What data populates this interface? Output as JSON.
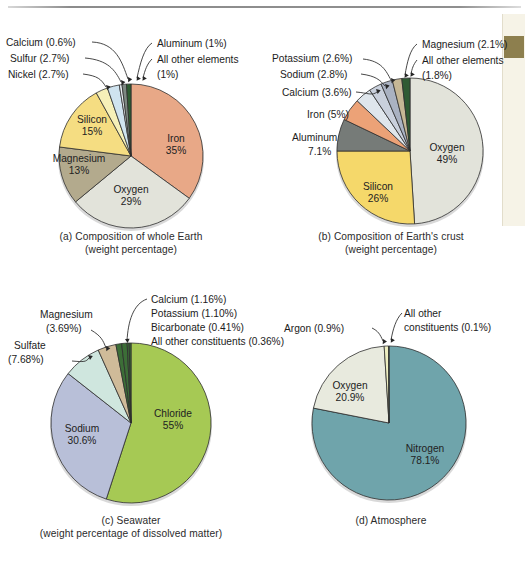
{
  "figure": {
    "title_visible": false,
    "background": "#ffffff",
    "rule_color": "#8c8c8c",
    "page_edge_color": "#f6f3e7",
    "page_tab_color": "#8d7f4e"
  },
  "chart_data": [
    {
      "id": "a",
      "type": "pie",
      "title": "(a) Composition of whole Earth",
      "subtitle": "(weight percentage)",
      "unit": "weight percent",
      "legend_position": "callout-labels",
      "categories": [
        "Iron",
        "Oxygen",
        "Magnesium",
        "Silicon",
        "Calcium",
        "Sulfur",
        "Nickel",
        "Aluminum",
        "All other elements"
      ],
      "values": [
        35,
        29,
        13,
        15,
        0.6,
        2.7,
        2.7,
        1,
        1
      ],
      "labels": [
        {
          "name": "Iron",
          "pct": "35%",
          "text": "Iron",
          "value_text": "35%",
          "inside": true,
          "color": "#e8a887"
        },
        {
          "name": "Oxygen",
          "pct": "29%",
          "text": "Oxygen",
          "value_text": "29%",
          "inside": true,
          "color": "#e2e3da"
        },
        {
          "name": "Magnesium",
          "pct": "13%",
          "text": "Magnesium",
          "value_text": "13%",
          "inside": true,
          "color": "#b3aa8d"
        },
        {
          "name": "Silicon",
          "pct": "15%",
          "text": "Silicon",
          "value_text": "15%",
          "inside": true,
          "color": "#f5dd82"
        },
        {
          "name": "Nickel",
          "pct": "2.7%",
          "text": "Nickel (2.7%)",
          "inside": false,
          "color": "#f6f0b8"
        },
        {
          "name": "Sulfur",
          "pct": "2.7%",
          "text": "Sulfur (2.7%)",
          "inside": false,
          "color": "#cfe3ef"
        },
        {
          "name": "Calcium",
          "pct": "0.6%",
          "text": "Calcium (0.6%)",
          "inside": false,
          "color": "#e8edf0"
        },
        {
          "name": "Aluminum",
          "pct": "1%",
          "text": "Aluminum (1%)",
          "inside": false,
          "color": "#7d8882"
        },
        {
          "name": "All other elements",
          "pct": "1%",
          "text": "All other elements",
          "text2": "(1%)",
          "inside": false,
          "color": "#2e5c32"
        }
      ]
    },
    {
      "id": "b",
      "type": "pie",
      "title": "(b) Composition of Earth's crust",
      "subtitle": "(weight percentage)",
      "unit": "weight percent",
      "legend_position": "callout-labels",
      "categories": [
        "Oxygen",
        "Silicon",
        "Aluminum",
        "Iron",
        "Calcium",
        "Sodium",
        "Potassium",
        "Magnesium",
        "All other elements"
      ],
      "values": [
        49,
        26,
        7.1,
        5,
        3.6,
        2.8,
        2.6,
        2.1,
        1.8
      ],
      "labels": [
        {
          "name": "Oxygen",
          "pct": "49%",
          "text": "Oxygen",
          "value_text": "49%",
          "inside": true,
          "color": "#e2e3da"
        },
        {
          "name": "Silicon",
          "pct": "26%",
          "text": "Silicon",
          "value_text": "26%",
          "inside": true,
          "color": "#f5d86a"
        },
        {
          "name": "Aluminum",
          "pct": "7.1%",
          "text": "Aluminum",
          "value_text": "7.1%",
          "inside": false,
          "color": "#767b78"
        },
        {
          "name": "Iron",
          "pct": "5%",
          "text": "Iron (5%)",
          "inside": false,
          "color": "#eca277"
        },
        {
          "name": "Calcium",
          "pct": "3.6%",
          "text": "Calcium (3.6%)",
          "inside": false,
          "color": "#dfe6ec"
        },
        {
          "name": "Sodium",
          "pct": "2.8%",
          "text": "Sodium (2.8%)",
          "inside": false,
          "color": "#c9d0dc"
        },
        {
          "name": "Potassium",
          "pct": "2.6%",
          "text": "Potassium (2.6%)",
          "inside": false,
          "color": "#aab2c2"
        },
        {
          "name": "Magnesium",
          "pct": "2.1%",
          "text": "Magnesium (2.1%)",
          "inside": false,
          "color": "#c6b795"
        },
        {
          "name": "All other elements",
          "pct": "1.8%",
          "text": "All other elements",
          "text2": "(1.8%)",
          "inside": false,
          "color": "#2f5b33"
        }
      ]
    },
    {
      "id": "c",
      "type": "pie",
      "title": "(c) Seawater",
      "subtitle": "(weight percentage of dissolved matter)",
      "unit": "weight percentage of dissolved matter",
      "legend_position": "callout-labels",
      "categories": [
        "Chloride",
        "Sodium",
        "Sulfate",
        "Magnesium",
        "Calcium",
        "Potassium",
        "Bicarbonate",
        "All other constituents"
      ],
      "values": [
        55,
        30.6,
        7.68,
        3.69,
        1.16,
        1.1,
        0.41,
        0.36
      ],
      "labels": [
        {
          "name": "Chloride",
          "pct": "55%",
          "text": "Chloride",
          "value_text": "55%",
          "inside": true,
          "color": "#a6c954"
        },
        {
          "name": "Sodium",
          "pct": "30.6%",
          "text": "Sodium",
          "value_text": "30.6%",
          "inside": true,
          "color": "#b8bfd8"
        },
        {
          "name": "Sulfate",
          "pct": "7.68%",
          "text": "Sulfate",
          "text2": "(7.68%)",
          "inside": false,
          "color": "#cfe6de"
        },
        {
          "name": "Magnesium",
          "pct": "3.69%",
          "text": "Magnesium",
          "text2": "(3.69%)",
          "inside": false,
          "color": "#cfbb99"
        },
        {
          "name": "Calcium",
          "pct": "1.16%",
          "text": "Calcium (1.16%)",
          "inside": false,
          "color": "#3c6e37"
        },
        {
          "name": "Potassium",
          "pct": "1.10%",
          "text": "Potassium (1.10%)",
          "inside": false,
          "color": "#3c6e37"
        },
        {
          "name": "Bicarbonate",
          "pct": "0.41%",
          "text": "Bicarbonate (0.41%)",
          "inside": false,
          "color": "#3c6e37"
        },
        {
          "name": "All other constituents",
          "pct": "0.36%",
          "text": "All other constituents (0.36%)",
          "inside": false,
          "color": "#3c6e37"
        }
      ]
    },
    {
      "id": "d",
      "type": "pie",
      "title": "(d) Atmosphere",
      "subtitle": "",
      "unit": "volume percentage",
      "legend_position": "callout-labels",
      "categories": [
        "Nitrogen",
        "Oxygen",
        "Argon",
        "All other constituents"
      ],
      "values": [
        78.1,
        20.9,
        0.9,
        0.1
      ],
      "labels": [
        {
          "name": "Nitrogen",
          "pct": "78.1%",
          "text": "Nitrogen",
          "value_text": "78.1%",
          "inside": true,
          "color": "#6fa4ab"
        },
        {
          "name": "Oxygen",
          "pct": "20.9%",
          "text": "Oxygen",
          "value_text": "20.9%",
          "inside": true,
          "color": "#e8eade"
        },
        {
          "name": "Argon",
          "pct": "0.9%",
          "text": "Argon (0.9%)",
          "inside": false,
          "color": "#edeec0"
        },
        {
          "name": "All other constituents",
          "pct": "0.1%",
          "text": "All other",
          "text2": "constituents (0.1%)",
          "inside": false,
          "color": "#b9bd6a"
        }
      ]
    }
  ]
}
